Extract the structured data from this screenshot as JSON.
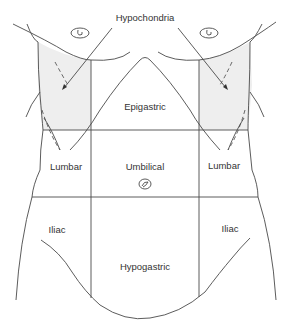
{
  "diagram": {
    "labels": {
      "hypochondria": "Hypochondria",
      "epigastric": "Epigastric",
      "lumbar_left": "Lumbar",
      "umbilical": "Umbilical",
      "lumbar_right": "Lumbar",
      "iliac_left": "Iliac",
      "hypogastric": "Hypogastric",
      "iliac_right": "Iliac"
    },
    "colors": {
      "line": "#4a4a4a",
      "shade": "#eeeeee",
      "text": "#333333",
      "background": "#ffffff"
    }
  }
}
